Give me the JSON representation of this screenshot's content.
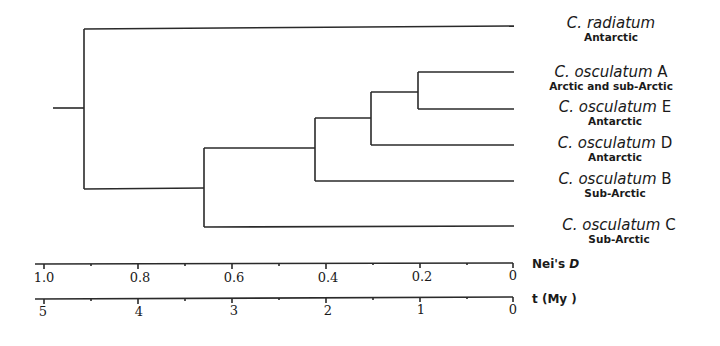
{
  "figure": {
    "taxa": [
      {
        "genus": "C.",
        "species": "radiatum",
        "suffix": "",
        "region": "Antarctic"
      },
      {
        "genus": "C.",
        "species": "osculatum",
        "suffix": "A",
        "region": "Arctic and sub-Arctic"
      },
      {
        "genus": "C.",
        "species": "osculatum",
        "suffix": "E",
        "region": "Antarctic"
      },
      {
        "genus": "C.",
        "species": "osculatum",
        "suffix": "D",
        "region": "Antarctic"
      },
      {
        "genus": "C.",
        "species": "osculatum",
        "suffix": "B",
        "region": "Sub-Arctic"
      },
      {
        "genus": "C.",
        "species": "osculatum",
        "suffix": "C",
        "region": "Sub-Arctic"
      }
    ],
    "nodes_neis_D": {
      "root": 0.915,
      "osculatum_all": 0.66,
      "B_D_E_A": 0.42,
      "D_E_A": 0.3,
      "A_E": 0.2
    },
    "axis_neis_d": {
      "label_prefix": "Nei's",
      "label_var": "D",
      "ticks": [
        "1.0",
        "0.8",
        "0.6",
        "0.4",
        "0.2",
        "0"
      ]
    },
    "axis_time": {
      "label": "t (My )",
      "ticks": [
        "5",
        "4",
        "3",
        "2",
        "1",
        "0"
      ]
    }
  }
}
